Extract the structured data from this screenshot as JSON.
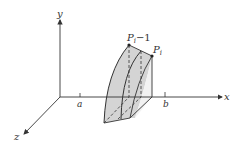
{
  "diagram": {
    "axes": {
      "x_label": "x",
      "y_label": "y",
      "z_label": "z"
    },
    "ticks": {
      "a_label": "a",
      "b_label": "b"
    },
    "points": {
      "p_prev_main": "P",
      "p_prev_sub": "i",
      "p_prev_suffix": "−1",
      "p_curr_main": "P",
      "p_curr_sub": "i"
    },
    "colors": {
      "stroke": "#333333",
      "shade": "#cfcfcf",
      "background": "#ffffff"
    }
  }
}
